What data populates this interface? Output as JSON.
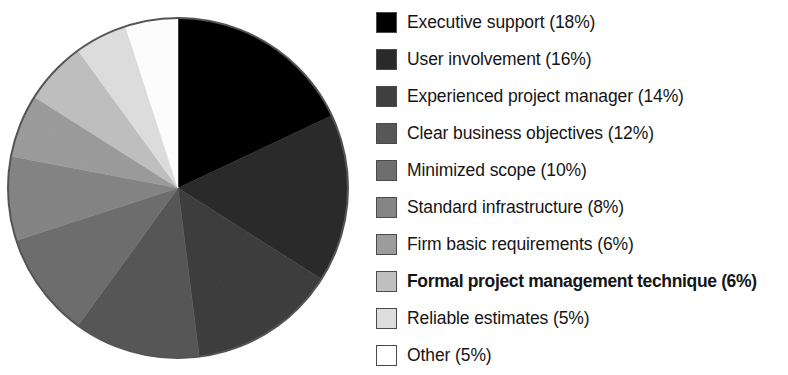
{
  "figure": {
    "background_color": "#ffffff",
    "text_color": "#151515"
  },
  "legend": {
    "position": "right",
    "items": [
      {
        "label": "Executive support (18%)",
        "color": "#000000",
        "bold": false
      },
      {
        "label": "User involvement (16%)",
        "color": "#2a2a2a",
        "bold": false
      },
      {
        "label": "Experienced project manager (14%)",
        "color": "#3f3f3f",
        "bold": false
      },
      {
        "label": "Clear business objectives (12%)",
        "color": "#575757",
        "bold": false
      },
      {
        "label": "Minimized scope (10%)",
        "color": "#6e6e6e",
        "bold": false
      },
      {
        "label": "Standard infrastructure (8%)",
        "color": "#858585",
        "bold": false
      },
      {
        "label": "Firm basic requirements (6%)",
        "color": "#9c9c9c",
        "bold": false
      },
      {
        "label": "Formal project management technique (6%)",
        "color": "#c0c0c0",
        "bold": true
      },
      {
        "label": "Reliable estimates (5%)",
        "color": "#dedede",
        "bold": false
      },
      {
        "label": "Other (5%)",
        "color": "#ffffff",
        "bold": false
      }
    ]
  },
  "chart_data": {
    "type": "pie",
    "title": "",
    "xlabel": "",
    "ylabel": "",
    "start_angle_deg": 0,
    "direction": "clockwise",
    "units": "percent",
    "total": 100,
    "categories": [
      "Executive support",
      "User involvement",
      "Experienced project manager",
      "Clear business objectives",
      "Minimized scope",
      "Standard infrastructure",
      "Firm basic requirements",
      "Formal project management technique",
      "Reliable estimates",
      "Other"
    ],
    "values": [
      18,
      16,
      14,
      12,
      10,
      8,
      6,
      6,
      5,
      5
    ],
    "labels": [
      "Executive support (18%)",
      "User involvement (16%)",
      "Experienced project manager (14%)",
      "Clear business objectives (12%)",
      "Minimized scope (10%)",
      "Standard infrastructure (8%)",
      "Firm basic requirements (6%)",
      "Formal project management technique (6%)",
      "Reliable estimates (5%)",
      "Other (5%)"
    ],
    "colors": [
      "#000000",
      "#2a2a2a",
      "#3f3f3f",
      "#575757",
      "#6e6e6e",
      "#858585",
      "#9c9c9c",
      "#c0c0c0",
      "#dedede",
      "#ffffff"
    ],
    "geometry": {
      "center_x": 178,
      "center_y": 188,
      "radius": 170,
      "outline_color": "#555555"
    },
    "legend": true,
    "grid": false
  }
}
